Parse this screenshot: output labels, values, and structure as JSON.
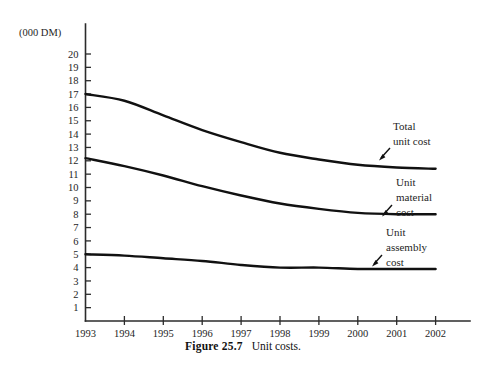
{
  "figure": {
    "caption_number": "Figure 25.7",
    "caption_text": "Unit costs.",
    "unit_label": "(000 DM)"
  },
  "annotations": {
    "total": {
      "line1": "Total",
      "line2": "unit cost"
    },
    "material": {
      "line1": "Unit",
      "line2": "material",
      "line3": "cost"
    },
    "assembly": {
      "line1": "Unit",
      "line2": "assembly",
      "line3": "cost"
    }
  },
  "axis": {
    "y_ticks": [
      "20",
      "19",
      "18",
      "17",
      "16",
      "15",
      "14",
      "13",
      "12",
      "11",
      "10",
      "9",
      "8",
      "7",
      "6",
      "5",
      "4",
      "3",
      "2",
      "1"
    ],
    "x_ticks": [
      "1993",
      "1994",
      "1995",
      "1996",
      "1997",
      "1998",
      "1999",
      "2000",
      "2001",
      "2002"
    ]
  },
  "colors": {
    "line": "#111111",
    "axis": "#2b2b2b",
    "background": "#ffffff"
  },
  "chart_data": {
    "type": "line",
    "title": "Unit costs",
    "xlabel": "",
    "ylabel": "(000 DM)",
    "xlim": [
      1993,
      2002
    ],
    "ylim": [
      0,
      20
    ],
    "grid": false,
    "legend": "annotations at right of each curve",
    "categories": [
      1993,
      1994,
      1995,
      1996,
      1997,
      1998,
      1999,
      2000,
      2001,
      2002
    ],
    "series": [
      {
        "name": "Total unit cost",
        "values": [
          17.0,
          16.5,
          15.4,
          14.3,
          13.4,
          12.6,
          12.1,
          11.7,
          11.5,
          11.4
        ]
      },
      {
        "name": "Unit material cost",
        "values": [
          12.2,
          11.6,
          10.9,
          10.1,
          9.4,
          8.8,
          8.4,
          8.1,
          8.0,
          8.0
        ]
      },
      {
        "name": "Unit assembly cost",
        "values": [
          5.0,
          4.9,
          4.7,
          4.5,
          4.2,
          4.0,
          4.0,
          3.9,
          3.9,
          3.9
        ]
      }
    ]
  }
}
